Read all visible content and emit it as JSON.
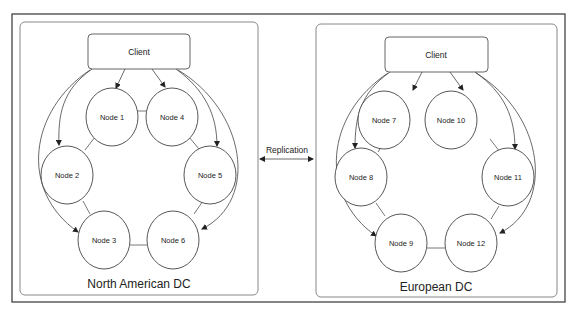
{
  "diagram": {
    "replication_label": "Replication",
    "datacenters": [
      {
        "label": "North American DC",
        "client_label": "Client",
        "nodes": [
          {
            "label": "Node 1"
          },
          {
            "label": "Node 4"
          },
          {
            "label": "Node 2"
          },
          {
            "label": "Node 5"
          },
          {
            "label": "Node 3"
          },
          {
            "label": "Node 6"
          }
        ]
      },
      {
        "label": "European DC",
        "client_label": "Client",
        "nodes": [
          {
            "label": "Node 7"
          },
          {
            "label": "Node 10"
          },
          {
            "label": "Node 8"
          },
          {
            "label": "Node 11"
          },
          {
            "label": "Node 9"
          },
          {
            "label": "Node 12"
          }
        ]
      }
    ],
    "colors": {
      "stroke": "#333333",
      "frame": "#444444",
      "box": "#777777",
      "background": "#ffffff"
    }
  }
}
